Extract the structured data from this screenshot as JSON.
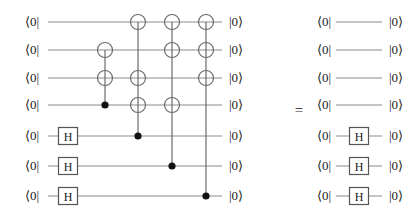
{
  "figure": {
    "type": "quantum-circuit-identity",
    "equals_symbol": "=",
    "wire_count": 7,
    "bra_label": "⟨0|",
    "ket_label": "|0⟩",
    "gate_labels": {
      "hadamard": "H",
      "cnot_target": "⊕",
      "control": "●"
    }
  },
  "left_circuit": {
    "name": "left-circuit",
    "wires": [
      {
        "index": 1,
        "bra": "⟨0|",
        "ket": "|0⟩",
        "y": 22
      },
      {
        "index": 2,
        "bra": "⟨0|",
        "ket": "|0⟩",
        "y": 50
      },
      {
        "index": 3,
        "bra": "⟨0|",
        "ket": "|0⟩",
        "y": 78
      },
      {
        "index": 4,
        "bra": "⟨0|",
        "ket": "|0⟩",
        "y": 105
      },
      {
        "index": 5,
        "bra": "⟨0|",
        "ket": "|0⟩",
        "y": 136
      },
      {
        "index": 6,
        "bra": "⟨0|",
        "ket": "|0⟩",
        "y": 166
      },
      {
        "index": 7,
        "bra": "⟨0|",
        "ket": "|0⟩",
        "y": 196
      }
    ],
    "wire_x_start": 48,
    "wire_x_end": 222,
    "bra_x": 32,
    "ket_x": 236,
    "hadamards": [
      {
        "wire": 5,
        "x": 68,
        "label": "H"
      },
      {
        "wire": 6,
        "x": 68,
        "label": "H"
      },
      {
        "wire": 7,
        "x": 68,
        "label": "H"
      }
    ],
    "multi_gates": [
      {
        "name": "cnot-column-1",
        "x": 105,
        "control_wire": 4,
        "target_wires": [
          2,
          3
        ]
      },
      {
        "name": "cnot-column-2",
        "x": 138,
        "control_wire": 5,
        "target_wires": [
          1,
          3,
          4
        ]
      },
      {
        "name": "cnot-column-3",
        "x": 172,
        "control_wire": 6,
        "target_wires": [
          1,
          2,
          4
        ]
      },
      {
        "name": "cnot-column-4",
        "x": 206,
        "control_wire": 7,
        "target_wires": [
          1,
          2,
          3
        ]
      }
    ]
  },
  "right_circuit": {
    "name": "right-circuit",
    "wires": [
      {
        "index": 1,
        "bra": "⟨0|",
        "ket": "|0⟩",
        "y": 22
      },
      {
        "index": 2,
        "bra": "⟨0|",
        "ket": "|0⟩",
        "y": 50
      },
      {
        "index": 3,
        "bra": "⟨0|",
        "ket": "|0⟩",
        "y": 78
      },
      {
        "index": 4,
        "bra": "⟨0|",
        "ket": "|0⟩",
        "y": 105
      },
      {
        "index": 5,
        "bra": "⟨0|",
        "ket": "|0⟩",
        "y": 136
      },
      {
        "index": 6,
        "bra": "⟨0|",
        "ket": "|0⟩",
        "y": 166
      },
      {
        "index": 7,
        "bra": "⟨0|",
        "ket": "|0⟩",
        "y": 196
      }
    ],
    "wire_x_start": 336,
    "wire_x_end": 382,
    "bra_x": 324,
    "ket_x": 396,
    "hadamards": [
      {
        "wire": 5,
        "x": 359,
        "label": "H"
      },
      {
        "wire": 6,
        "x": 359,
        "label": "H"
      },
      {
        "wire": 7,
        "x": 359,
        "label": "H"
      }
    ]
  },
  "equals": {
    "symbol": "=",
    "x": 299,
    "y": 110
  },
  "style": {
    "wire_color": "#8c8c8c",
    "gate_line_color": "#6b6b6b",
    "control_color": "#111111",
    "text_color": "#1a1a1a",
    "box_stroke": "#555555",
    "background": "#ffffff"
  }
}
